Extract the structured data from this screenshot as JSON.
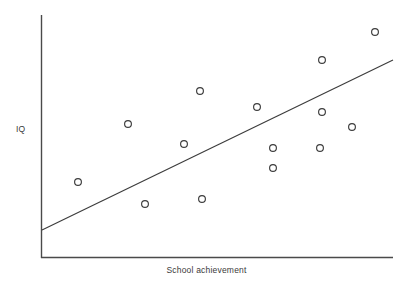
{
  "chart_data": {
    "type": "scatter",
    "title": "",
    "xlabel": "School achievement",
    "ylabel": "IQ",
    "xlim": [
      0,
      100
    ],
    "ylim": [
      0,
      100
    ],
    "grid": false,
    "legend": null,
    "axes": {
      "x_axis_pixels": {
        "x1": 41,
        "y1": 258,
        "x2": 393,
        "y2": 258
      },
      "y_axis_pixels": {
        "x1": 41,
        "y1": 15,
        "x2": 41,
        "y2": 258
      },
      "ticks_visible": false,
      "tick_labels_x": [],
      "tick_labels_y": []
    },
    "series": [
      {
        "name": "observations",
        "marker": "open-circle",
        "marker_size_px": 8,
        "color": "#3c3c3c",
        "points": [
          {
            "x": 10.5,
            "y": 31.3,
            "px": 78,
            "py": 182
          },
          {
            "x": 24.7,
            "y": 55.1,
            "px": 128,
            "py": 124
          },
          {
            "x": 29.5,
            "y": 22.2,
            "px": 145,
            "py": 204
          },
          {
            "x": 40.6,
            "y": 46.9,
            "px": 184,
            "py": 144
          },
          {
            "x": 45.7,
            "y": 24.3,
            "px": 202,
            "py": 199
          },
          {
            "x": 45.2,
            "y": 68.7,
            "px": 200,
            "py": 91
          },
          {
            "x": 61.4,
            "y": 62.1,
            "px": 257,
            "py": 107
          },
          {
            "x": 65.9,
            "y": 45.3,
            "px": 273,
            "py": 148
          },
          {
            "x": 65.9,
            "y": 37.0,
            "px": 273,
            "py": 168
          },
          {
            "x": 79.3,
            "y": 81.5,
            "px": 322,
            "py": 60
          },
          {
            "x": 79.3,
            "y": 60.1,
            "px": 322,
            "py": 112
          },
          {
            "x": 79.3,
            "y": 45.3,
            "px": 320,
            "py": 148
          },
          {
            "x": 88.4,
            "y": 53.9,
            "px": 352,
            "py": 127
          },
          {
            "x": 94.9,
            "y": 93.0,
            "px": 375,
            "py": 32
          },
          {
            "x": 79.3,
            "y": 45.3,
            "px": 320,
            "py": 148
          }
        ]
      }
    ],
    "trendline": {
      "name": "regression-line",
      "color": "#3c3c3c",
      "width_px": 1,
      "start": {
        "px": 42,
        "py": 230
      },
      "end": {
        "px": 393,
        "py": 60
      }
    },
    "colors": {
      "axis": "#4a4a4a",
      "marker_stroke": "#3c3c3c",
      "trendline": "#3c3c3c",
      "text": "#3a3a3a",
      "background": "#ffffff"
    }
  }
}
